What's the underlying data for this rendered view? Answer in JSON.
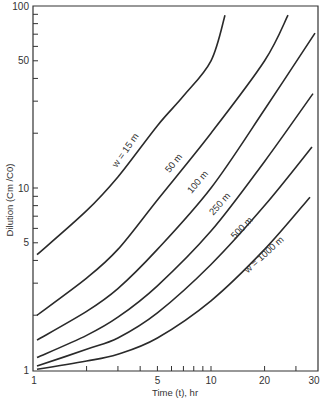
{
  "chart_data": {
    "type": "line",
    "title": "",
    "xlabel": "Time (t), hr",
    "ylabel": "Dilution (Cm/C0)",
    "xscale": "log",
    "yscale": "log",
    "xlim": [
      1,
      30
    ],
    "ylim": [
      1,
      100
    ],
    "grid": false,
    "legend": "none (inline curve labels)",
    "x_tick_labels": [
      "1",
      "5",
      "10",
      "20",
      "30"
    ],
    "y_tick_labels": [
      "1",
      "5",
      "10",
      "50",
      "100"
    ],
    "series": [
      {
        "name": "w = 15 m",
        "label": "w = 15 m",
        "x": [
          1,
          2,
          3,
          5,
          7,
          10,
          12
        ],
        "values": [
          4.3,
          7.5,
          11.5,
          22,
          32,
          50,
          89
        ]
      },
      {
        "name": "50 m",
        "label": "50 m",
        "x": [
          1,
          2,
          3,
          5,
          10,
          20,
          27
        ],
        "values": [
          2.0,
          3.2,
          4.6,
          8.6,
          20,
          50,
          89
        ]
      },
      {
        "name": "100 m",
        "label": "100 m",
        "x": [
          1,
          2,
          3,
          5,
          10,
          20,
          30
        ],
        "values": [
          1.46,
          2.1,
          2.8,
          4.6,
          10,
          27,
          71
        ]
      },
      {
        "name": "250 m",
        "label": "250 m",
        "x": [
          1,
          2,
          3,
          5,
          10,
          20,
          30
        ],
        "values": [
          1.17,
          1.55,
          1.95,
          2.9,
          5.8,
          14,
          33
        ]
      },
      {
        "name": "500 m",
        "label": "500 m",
        "x": [
          1,
          2,
          3,
          5,
          10,
          20,
          30
        ],
        "values": [
          1.05,
          1.3,
          1.5,
          2.06,
          3.8,
          8.0,
          16.8
        ]
      },
      {
        "name": "w = 1000 m",
        "label": "w = 1000 m",
        "x": [
          1,
          2,
          3,
          5,
          10,
          20,
          30
        ],
        "values": [
          1.01,
          1.12,
          1.22,
          1.5,
          2.4,
          4.6,
          8.9
        ]
      }
    ]
  },
  "axes": {
    "x_title": "Time (t), hr",
    "y_title": "Dilution (Cm /C0)"
  }
}
